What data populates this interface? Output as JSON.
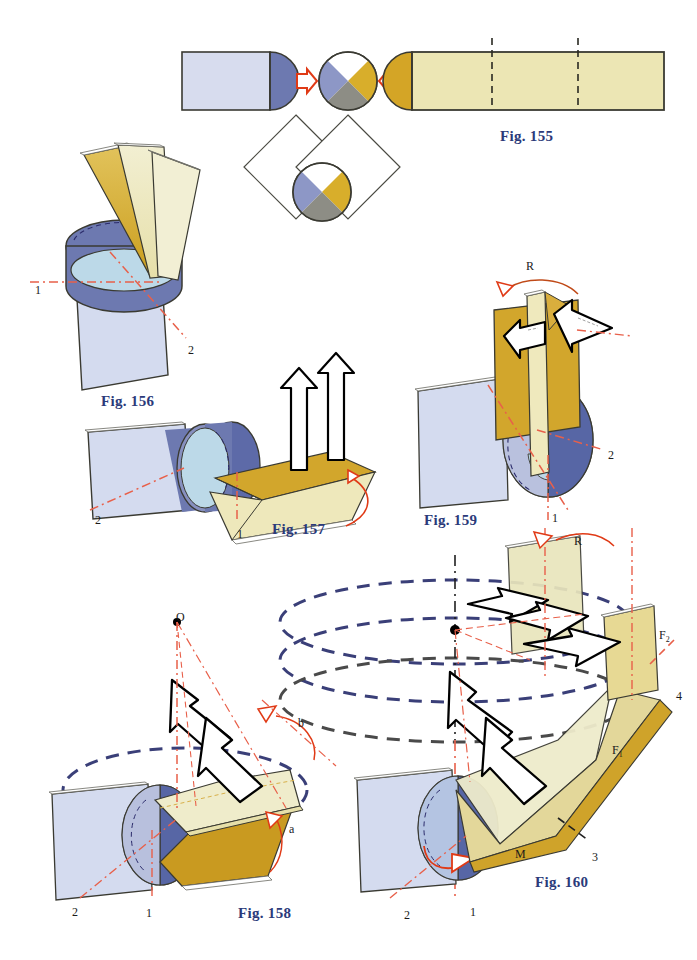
{
  "document": {
    "title": "Technical figures 155 to 160 — plate and cylinder kinematics",
    "background_color": "#ffffff",
    "width": 697,
    "height": 960
  },
  "palette": {
    "caption_blue": "#2b3a7a",
    "outline_dark": "#3a3a32",
    "gold_dark": "#d4a526",
    "gold_mid": "#e0c25f",
    "yellow_pale": "#ece6b4",
    "cream": "#f0ecc8",
    "blue_pale": "#d6dcef",
    "blue_lavender": "#c8d0e8",
    "blue_slate": "#6d79b0",
    "blue_deep": "#5766a5",
    "cyan_pale": "#bcd9e8",
    "gray_mid": "#8d8d85",
    "red_arrow": "#e03a16",
    "red_dash": "#e8604a",
    "navy_dash": "#3a3f78",
    "gray_dash": "#4a4a4a",
    "arrow_white": "#ffffff",
    "arrow_outline": "#000000"
  },
  "figures": [
    {
      "id": "fig-155",
      "caption": "Fig. 155",
      "caption_x": 500,
      "caption_y": 128,
      "description": "Blue capsule block at left, quadrant circle in middle, gold capsule block at right, joined by two red hollow arrows pointing inward; two overlapping diamond outlines below with a second quadrant circle."
    },
    {
      "id": "fig-156",
      "caption": "Fig. 156",
      "caption_x": 101,
      "caption_y": 393,
      "description": "Cylinder with three fanned plates rising from it over a vertical plate; axes 1 and 2 in red dash-dot.",
      "labels": [
        {
          "text": "1",
          "x": 35,
          "y": 283
        },
        {
          "text": "2",
          "x": 188,
          "y": 343
        }
      ]
    },
    {
      "id": "fig-157",
      "caption": "Fig. 157",
      "caption_x": 272,
      "caption_y": 521,
      "description": "Horizontal cylinder against a vertical plate with a folded gold plate, two large white block arrows pointing up and a red rotation arc.",
      "labels": [
        {
          "text": "2",
          "x": 95,
          "y": 513
        },
        {
          "text": "1",
          "x": 237,
          "y": 527
        }
      ]
    },
    {
      "id": "fig-159",
      "caption": "Fig. 159",
      "caption_x": 424,
      "caption_y": 512,
      "description": "Vertical gold plate pair on a cylinder with two opposed white block arrows and an R rotation arc.",
      "labels": [
        {
          "text": "R",
          "x": 526,
          "y": 259
        },
        {
          "text": "2",
          "x": 608,
          "y": 448
        },
        {
          "text": "1",
          "x": 552,
          "y": 511
        }
      ]
    },
    {
      "id": "fig-158",
      "caption": "Fig. 158",
      "caption_x": 238,
      "caption_y": 905,
      "description": "Cylinder with tilted plates, a navy dashed ellipse, apex point O with red dash-dot cone lines, white zig-zag block arrows, and angles a and b marked in red.",
      "labels": [
        {
          "text": "O",
          "x": 176,
          "y": 610
        },
        {
          "text": "b",
          "x": 298,
          "y": 716
        },
        {
          "text": "a",
          "x": 289,
          "y": 822
        },
        {
          "text": "2",
          "x": 72,
          "y": 905
        },
        {
          "text": "1",
          "x": 146,
          "y": 906
        }
      ]
    },
    {
      "id": "fig-160",
      "caption": "Fig. 160",
      "caption_x": 535,
      "caption_y": 874,
      "description": "Cylinder with a long inclined fold, three dashed ellipses around a vertical axis, white block arrows, planes F1 and F2, and axes 1, 2, 3, 4 plus M.",
      "labels": [
        {
          "text": "R",
          "x": 574,
          "y": 534
        },
        {
          "text": "F",
          "x": 659,
          "y": 628,
          "sub": "2"
        },
        {
          "text": "4",
          "x": 676,
          "y": 689
        },
        {
          "text": "F",
          "x": 612,
          "y": 743,
          "sub": "1"
        },
        {
          "text": "3",
          "x": 592,
          "y": 850
        },
        {
          "text": "M",
          "x": 515,
          "y": 847
        },
        {
          "text": "2",
          "x": 404,
          "y": 908
        },
        {
          "text": "1",
          "x": 470,
          "y": 905
        }
      ]
    }
  ]
}
